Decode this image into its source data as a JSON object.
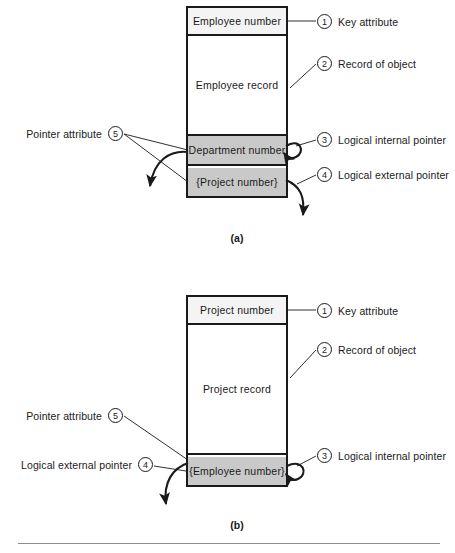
{
  "figure": {
    "panels": [
      {
        "id": "a",
        "caption": "(a)",
        "record": {
          "key_attribute": "Employee number",
          "record_body": "Employee record",
          "internal_pointer": "Department number",
          "external_pointer": "{Project number}"
        },
        "callouts_right": [
          {
            "number": "1",
            "label": "Key attribute"
          },
          {
            "number": "2",
            "label": "Record of object"
          },
          {
            "number": "3",
            "label": "Logical internal pointer"
          },
          {
            "number": "4",
            "label": "Logical external pointer"
          }
        ],
        "callouts_left": [
          {
            "number": "5",
            "label": "Pointer attribute"
          }
        ]
      },
      {
        "id": "b",
        "caption": "(b)",
        "record": {
          "key_attribute": "Project number",
          "record_body": "Project record",
          "external_pointer": "{Employee number}"
        },
        "callouts_right": [
          {
            "number": "1",
            "label": "Key attribute"
          },
          {
            "number": "2",
            "label": "Record of object"
          },
          {
            "number": "3",
            "label": "Logical internal pointer"
          }
        ],
        "callouts_left": [
          {
            "number": "5",
            "label": "Pointer attribute"
          },
          {
            "number": "4",
            "label": "Logical external pointer"
          }
        ]
      }
    ],
    "colors": {
      "pointer_fill": "#c9c9c9",
      "key_fill": "#f4f4f4",
      "outline": "#1a1a1a",
      "rule": "#8d8d8d"
    }
  }
}
